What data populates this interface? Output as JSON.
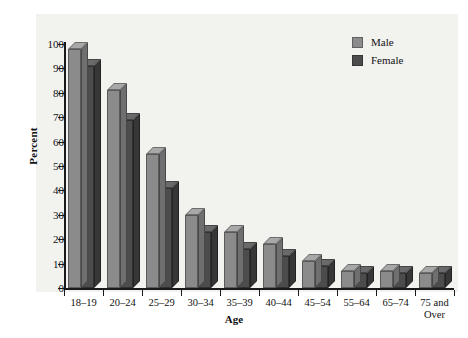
{
  "chart_data": {
    "type": "bar",
    "title": "",
    "xlabel": "Age",
    "ylabel": "Percent",
    "ylim": [
      0,
      100
    ],
    "yticks": [
      0,
      10,
      20,
      30,
      40,
      50,
      60,
      70,
      80,
      90,
      100
    ],
    "grid": false,
    "legend_position": "top-right",
    "categories": [
      "18–19",
      "20–24",
      "25–29",
      "30–34",
      "35–39",
      "40–44",
      "45–54",
      "55–64",
      "65–74",
      "75 and Over"
    ],
    "series": [
      {
        "name": "Male",
        "color": "#8b8b8b",
        "values": [
          98,
          81,
          55,
          30,
          23,
          18,
          11,
          7,
          7,
          6
        ]
      },
      {
        "name": "Female",
        "color": "#4c4c4c",
        "values": [
          91,
          69,
          41,
          23,
          16,
          13,
          9,
          6,
          6,
          6
        ]
      }
    ]
  },
  "legend": {
    "items": [
      {
        "label": "Male",
        "color": "#8b8b8b"
      },
      {
        "label": "Female",
        "color": "#4c4c4c"
      }
    ]
  },
  "colors": {
    "plot_background": "#f2f2ef",
    "axis": "#1a1a1a",
    "male_front": "#8b8b8b",
    "male_top": "#a8a8a8",
    "male_side": "#6f6f6f",
    "female_front": "#4c4c4c",
    "female_top": "#6a6a6a",
    "female_side": "#373737"
  }
}
